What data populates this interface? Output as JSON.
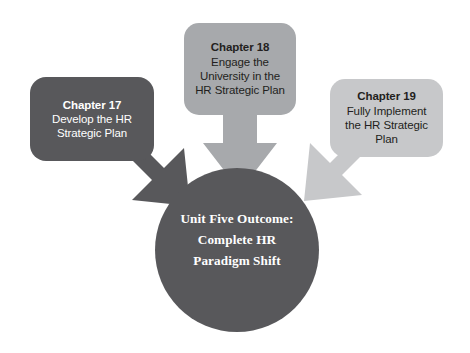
{
  "diagram": {
    "type": "convergence-flow",
    "title_semantic": "unit-five-outcome-diagram",
    "background_color": "#ffffff",
    "colors": {
      "dark_gray": "#58585b",
      "medium_gray": "#a7a9ac",
      "light_gray": "#c7c8ca",
      "text_on_dark": "#ffffff",
      "text_on_light": "#231f20"
    },
    "nodes": [
      {
        "id": "chapter-17",
        "title": "Chapter 17",
        "description_lines": [
          "Develop the HR",
          "Strategic Plan"
        ],
        "fill": "#58585b",
        "text_color": "#ffffff",
        "arrow_direction": "down-right"
      },
      {
        "id": "chapter-18",
        "title": "Chapter 18",
        "description_lines": [
          "Engage the",
          "University in the",
          "HR Strategic Plan"
        ],
        "fill": "#a7a9ac",
        "text_color": "#231f20",
        "arrow_direction": "down"
      },
      {
        "id": "chapter-19",
        "title": "Chapter 19",
        "description_lines": [
          "Fully Implement",
          "the HR Strategic",
          "Plan"
        ],
        "fill": "#c7c8ca",
        "text_color": "#231f20",
        "arrow_direction": "down-left"
      }
    ],
    "outcome": {
      "id": "unit-five-outcome",
      "lines": [
        "Unit Five Outcome:",
        "Complete HR",
        "Paradigm Shift"
      ],
      "fill": "#58585b",
      "text_color": "#ffffff",
      "shape": "circle"
    }
  }
}
